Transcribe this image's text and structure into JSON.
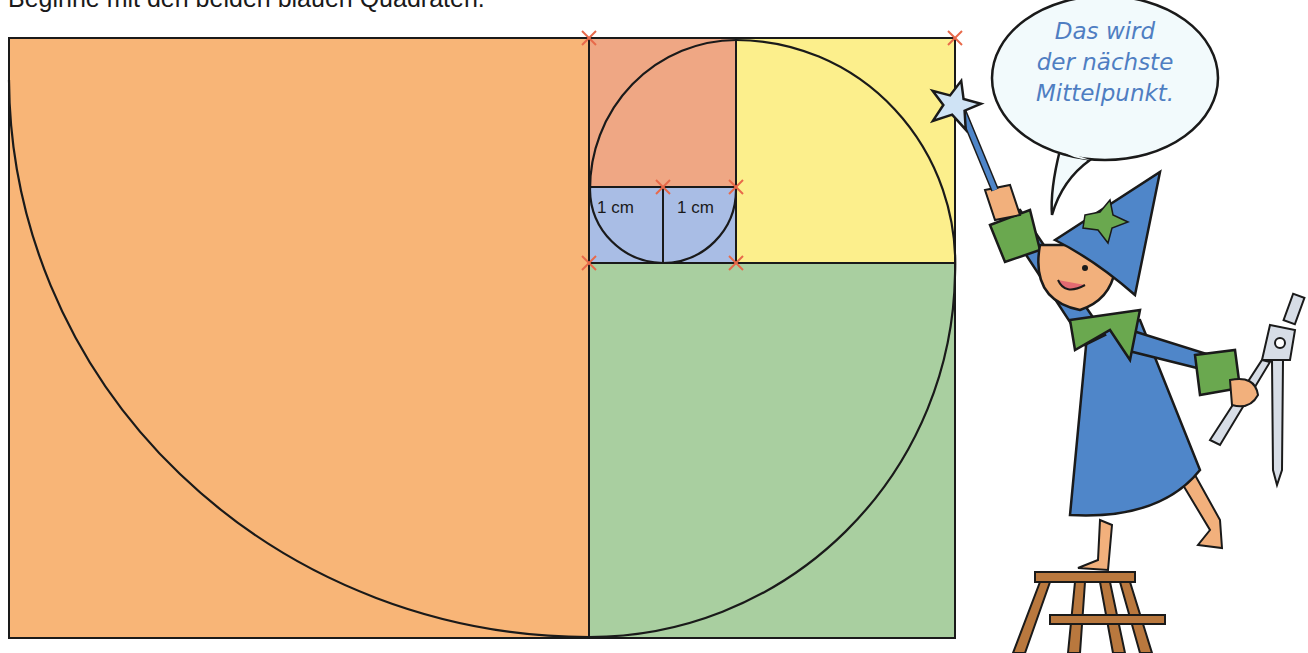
{
  "instruction": "Beginne mit den beiden blauen Quadraten.",
  "speech_bubble": {
    "lines": [
      "Das wird",
      "der nächste",
      "Mittelpunkt."
    ],
    "text_color": "#4f7ec2"
  },
  "diagram": {
    "type": "fibonacci-spiral-construction",
    "squares": [
      {
        "name": "blue-left",
        "color": "#A9BDE5",
        "label": "1 cm",
        "size_cm": 1
      },
      {
        "name": "blue-right",
        "color": "#A9BDE5",
        "label": "1 cm",
        "size_cm": 1
      },
      {
        "name": "red",
        "color": "#EFA784",
        "size_cm": 2
      },
      {
        "name": "yellow",
        "color": "#FCEF8C",
        "size_cm": 3
      },
      {
        "name": "green",
        "color": "#A9CFA0",
        "size_cm": 5
      },
      {
        "name": "orange",
        "color": "#F8B577",
        "size_cm": 8
      }
    ],
    "marker_color": "#E8694A",
    "line_color": "#1a1a1a"
  },
  "labels": {
    "blue_left": "1 cm",
    "blue_right": "1 cm"
  },
  "illustration": {
    "character": "wizard on stepladder",
    "props": [
      "star-wand",
      "compass"
    ]
  }
}
